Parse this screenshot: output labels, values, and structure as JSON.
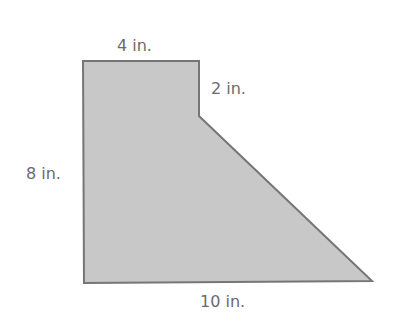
{
  "figure": {
    "shape": "composite polygon (rectangle + trapezoid)",
    "fill_color": "#c8c8c8",
    "stroke_color": "#767676",
    "label_color": "#6b6b6b",
    "vertices": [
      [
        83,
        61
      ],
      [
        199,
        61
      ],
      [
        199,
        116
      ],
      [
        372,
        281
      ],
      [
        84,
        283
      ]
    ]
  },
  "labels": {
    "top": "4 in.",
    "notch": "2 in.",
    "left": "8 in.",
    "bottom": "10 in."
  }
}
